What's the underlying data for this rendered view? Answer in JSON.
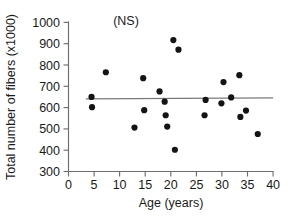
{
  "chart_data": {
    "type": "scatter",
    "title": "",
    "xlabel": "Age (years)",
    "ylabel": "Total number of fibers (x1000)",
    "xlim": [
      0,
      40
    ],
    "ylim": [
      300,
      1000
    ],
    "xticks": [
      0,
      5,
      10,
      15,
      20,
      25,
      30,
      35,
      40
    ],
    "yticks": [
      300,
      400,
      500,
      600,
      700,
      800,
      900,
      1000
    ],
    "xtick_labels": [
      "0",
      "5",
      "10",
      "15",
      "20",
      "25",
      "30",
      "35",
      "40"
    ],
    "ytick_labels": [
      "300",
      "400",
      "500",
      "600",
      "700",
      "800",
      "900",
      "1000"
    ],
    "grid": false,
    "legend": null,
    "annotations": [
      {
        "text": "(NS)",
        "x": 25,
        "y": 985,
        "meaning": "not-significant"
      }
    ],
    "series": [
      {
        "name": "Total number of fibers",
        "marker": "filled-circle",
        "color": "#141414",
        "points": [
          {
            "x": 4.5,
            "y": 650
          },
          {
            "x": 4.6,
            "y": 602
          },
          {
            "x": 7.3,
            "y": 766
          },
          {
            "x": 12.9,
            "y": 506
          },
          {
            "x": 14.6,
            "y": 738
          },
          {
            "x": 14.8,
            "y": 588
          },
          {
            "x": 17.8,
            "y": 676
          },
          {
            "x": 18.8,
            "y": 628
          },
          {
            "x": 19.0,
            "y": 564
          },
          {
            "x": 19.3,
            "y": 511
          },
          {
            "x": 20.5,
            "y": 917
          },
          {
            "x": 20.8,
            "y": 402
          },
          {
            "x": 21.5,
            "y": 872
          },
          {
            "x": 26.6,
            "y": 564
          },
          {
            "x": 26.8,
            "y": 636
          },
          {
            "x": 29.9,
            "y": 620
          },
          {
            "x": 30.3,
            "y": 720
          },
          {
            "x": 31.8,
            "y": 648
          },
          {
            "x": 33.4,
            "y": 752
          },
          {
            "x": 33.6,
            "y": 556
          },
          {
            "x": 34.7,
            "y": 586
          },
          {
            "x": 37.0,
            "y": 476
          }
        ]
      }
    ],
    "trendline": {
      "name": "regression-line",
      "color": "#7a7a7a",
      "x_start": 3.4,
      "y_start": 641,
      "x_end": 40.0,
      "y_end": 646,
      "significance": "NS"
    }
  }
}
